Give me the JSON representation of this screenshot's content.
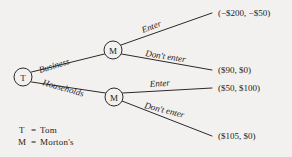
{
  "figure": {
    "background_color": "#f2f1ef",
    "line_color": "#2b2a28",
    "text_color": "#1d1c1b"
  },
  "nodes": [
    {
      "id": "root",
      "label": "T",
      "x": 23,
      "y": 77,
      "r": 9
    },
    {
      "id": "m_business",
      "label": "M",
      "x": 113,
      "y": 50,
      "r": 9
    },
    {
      "id": "m_households",
      "label": "M",
      "x": 114,
      "y": 97,
      "r": 9
    }
  ],
  "branch_labels": [
    {
      "id": "business",
      "text": "Business",
      "x": 40,
      "y": 73,
      "rotation": -17
    },
    {
      "id": "households",
      "text": "Households",
      "x": 42,
      "y": 85,
      "rotation": 16
    },
    {
      "id": "enter-business",
      "text": "Enter",
      "x": 143,
      "y": 33,
      "rotation": -21
    },
    {
      "id": "dont-enter-business",
      "text": "Don't enter",
      "x": 145,
      "y": 56,
      "rotation": 9
    },
    {
      "id": "enter-households",
      "text": "Enter",
      "x": 150,
      "y": 87,
      "rotation": -4
    },
    {
      "id": "dont-enter-households",
      "text": "Don't enter",
      "x": 144,
      "y": 108,
      "rotation": 14
    }
  ],
  "payoffs": [
    {
      "id": "business-enter",
      "text": "(−$200, −$50)",
      "x": 218,
      "y": 16
    },
    {
      "id": "business-dont-enter",
      "text": "($90, $0)",
      "x": 218,
      "y": 73
    },
    {
      "id": "households-enter",
      "text": "($50, $100)",
      "x": 218,
      "y": 91
    },
    {
      "id": "households-dont-enter",
      "text": "($105, $0)",
      "x": 218,
      "y": 139
    }
  ],
  "legend": {
    "entries": [
      {
        "id": "legend-t",
        "symbol": "T",
        "equals": "=",
        "name": "Tom"
      },
      {
        "id": "legend-m",
        "symbol": "M",
        "equals": "=",
        "name": "Morton's"
      }
    ]
  }
}
